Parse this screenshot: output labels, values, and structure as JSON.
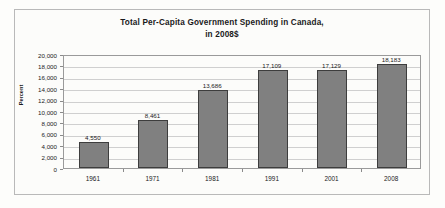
{
  "chart_data": {
    "type": "bar",
    "title": "Total Per-Capita Government Spending in Canada, in 2008$",
    "title_line1": "Total Per-Capita Government Spending in Canada,",
    "title_line2": "in 2008$",
    "xlabel": "",
    "ylabel": "Percent",
    "categories": [
      "1961",
      "1971",
      "1981",
      "1991",
      "2001",
      "2008"
    ],
    "values": [
      4550,
      8461,
      13686,
      17109,
      17129,
      18183
    ],
    "value_labels": [
      "4,550",
      "8,461",
      "13,686",
      "17,109",
      "17,129",
      "18,183"
    ],
    "ylim": [
      0,
      20000
    ],
    "ytick_values": [
      0,
      2000,
      4000,
      6000,
      8000,
      10000,
      12000,
      14000,
      16000,
      18000,
      20000
    ],
    "ytick_labels": [
      "0",
      "2,000",
      "4,000",
      "6,000",
      "8,000",
      "10,000",
      "12,000",
      "14,000",
      "16,000",
      "18,000",
      "20,000"
    ],
    "grid": true,
    "legend": false,
    "bar_color": "#808080",
    "bar_edge_color": "#3d3d3d",
    "gridline_color": "#cfcfcf",
    "plot_border_color": "#9a9a9a",
    "frame_color": "#b9b9b9",
    "background_color": "#fcfcfa",
    "text_color": "#1a1a1a"
  }
}
